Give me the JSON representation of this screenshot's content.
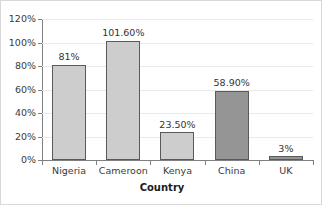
{
  "chart_data": {
    "type": "bar",
    "title": "",
    "xlabel": "Country",
    "ylabel": "",
    "categories": [
      "Nigeria",
      "Cameroon",
      "Kenya",
      "China",
      "UK"
    ],
    "values": [
      81,
      101.6,
      23.5,
      58.9,
      3
    ],
    "data_labels": [
      "81%",
      "101.60%",
      "23.50%",
      "58.90%",
      "3%"
    ],
    "bar_colors": [
      "#cdcdcd",
      "#cdcdcd",
      "#cdcdcd",
      "#959595",
      "#959595"
    ],
    "bar_border_color": "#595959",
    "ylim": [
      0,
      120
    ],
    "ytick_values": [
      0,
      20,
      40,
      60,
      80,
      100,
      120
    ],
    "ytick_labels": [
      "0%",
      "20%",
      "40%",
      "60%",
      "80%",
      "100%",
      "120%"
    ],
    "grid": true,
    "grid_color": "#e9e9e9",
    "legend": "none",
    "axis_color": "#808080",
    "background": "#ffffff"
  }
}
